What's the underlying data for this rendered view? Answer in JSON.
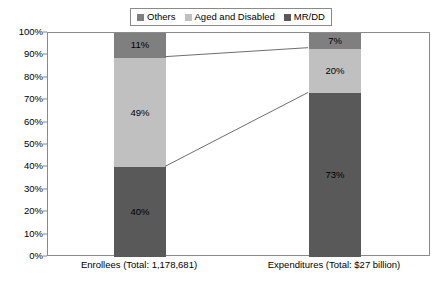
{
  "chart_data": {
    "type": "bar",
    "subtype": "100% stacked column with connector lines",
    "title": "",
    "xlabel": "",
    "ylabel": "",
    "ylim": [
      0,
      100
    ],
    "y_tick_labels": [
      "100%",
      "90%",
      "80%",
      "70%",
      "60%",
      "50%",
      "40%",
      "30%",
      "20%",
      "10%",
      "0%"
    ],
    "y_tick_values": [
      100,
      90,
      80,
      70,
      60,
      50,
      40,
      30,
      20,
      10,
      0
    ],
    "grid": false,
    "legend_position": "top-center",
    "categories": [
      "Enrollees (Total: 1,178,681)",
      "Expenditures (Total: $27 billion)"
    ],
    "series": [
      {
        "name": "MR/DD",
        "color": "#595959",
        "values": [
          40,
          73
        ],
        "labels": [
          "40%",
          "73%"
        ]
      },
      {
        "name": "Aged and Disabled",
        "color": "#c0c0c0",
        "values": [
          49,
          20
        ],
        "labels": [
          "49%",
          "20%"
        ]
      },
      {
        "name": "Others",
        "color": "#7f7f7f",
        "values": [
          11,
          7
        ],
        "labels": [
          "11%",
          "7%"
        ]
      }
    ],
    "stack_order_bottom_to_top": [
      "MR/DD",
      "Aged and Disabled",
      "Others"
    ],
    "connectors": [
      {
        "from_value": 40,
        "to_value": 73,
        "color": "#6e6e6e"
      },
      {
        "from_value": 89,
        "to_value": 93,
        "color": "#6e6e6e"
      }
    ]
  },
  "legend": {
    "items": [
      {
        "label": "Others",
        "color": "#7f7f7f"
      },
      {
        "label": "Aged and Disabled",
        "color": "#c0c0c0"
      },
      {
        "label": "MR/DD",
        "color": "#595959"
      }
    ]
  },
  "axis": {
    "border_color": "#8a8a8a"
  }
}
